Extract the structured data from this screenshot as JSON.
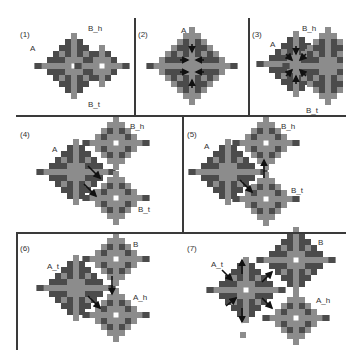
{
  "colors": {
    "dark": "#4b4b4b",
    "light": "#8c8c8c",
    "hole": "#ffffff",
    "arrow": "#111111",
    "divider": "#3a3a3a"
  },
  "cell": 6,
  "dividers": [
    {
      "x": 16,
      "y": 115,
      "w": 330,
      "h": 1.5
    },
    {
      "x": 16,
      "y": 232,
      "w": 330,
      "h": 1.5
    },
    {
      "x": 134,
      "y": 18,
      "w": 1.5,
      "h": 97
    },
    {
      "x": 248,
      "y": 18,
      "w": 1.5,
      "h": 97
    },
    {
      "x": 182,
      "y": 115,
      "w": 1.5,
      "h": 117
    },
    {
      "x": 16,
      "y": 232,
      "w": 1.5,
      "h": 118
    }
  ],
  "panels": [
    {
      "id": "1",
      "label": "(1)",
      "label_pos": [
        20,
        30
      ],
      "diamonds": [
        {
          "cx": 74,
          "cy": 66,
          "r": 5,
          "hole": true
        },
        {
          "cx": 102,
          "cy": 66,
          "r": 3,
          "hole": true
        }
      ],
      "node_labels": [
        {
          "text": "A",
          "x": 30,
          "y": 44
        },
        {
          "text": "B_h",
          "x": 88,
          "y": 24
        },
        {
          "text": "B_t",
          "x": 88,
          "y": 100
        }
      ],
      "arrows": []
    },
    {
      "id": "2",
      "label": "(2)",
      "label_pos": [
        138,
        30
      ],
      "diamonds": [
        {
          "cx": 192,
          "cy": 66,
          "r": 6,
          "hole": false
        }
      ],
      "node_labels": [
        {
          "text": "A",
          "x": 181,
          "y": 26
        }
      ],
      "arrows": [
        {
          "x1": 192,
          "y1": 44,
          "x2": 192,
          "y2": 52
        },
        {
          "x1": 192,
          "y1": 88,
          "x2": 192,
          "y2": 80
        },
        {
          "x1": 180,
          "y1": 60,
          "x2": 188,
          "y2": 60
        },
        {
          "x1": 204,
          "y1": 60,
          "x2": 196,
          "y2": 60
        },
        {
          "x1": 180,
          "y1": 72,
          "x2": 188,
          "y2": 72
        },
        {
          "x1": 204,
          "y1": 72,
          "x2": 196,
          "y2": 72
        }
      ]
    },
    {
      "id": "3",
      "label": "(3)",
      "label_pos": [
        252,
        30
      ],
      "diamonds": [
        {
          "cx": 296,
          "cy": 64,
          "r": 5,
          "hole": false
        },
        {
          "cx": 328,
          "cy": 66,
          "r": 6,
          "hole": false,
          "clip": [
            248,
            344
          ]
        }
      ],
      "node_labels": [
        {
          "text": "A",
          "x": 270,
          "y": 40
        },
        {
          "text": "B_h",
          "x": 302,
          "y": 24
        },
        {
          "text": "B_t",
          "x": 306,
          "y": 106
        }
      ],
      "arrows": [
        {
          "x1": 286,
          "y1": 54,
          "x2": 292,
          "y2": 60
        },
        {
          "x1": 306,
          "y1": 54,
          "x2": 300,
          "y2": 60
        },
        {
          "x1": 286,
          "y1": 76,
          "x2": 292,
          "y2": 70
        },
        {
          "x1": 306,
          "y1": 76,
          "x2": 300,
          "y2": 70
        },
        {
          "x1": 296,
          "y1": 46,
          "x2": 296,
          "y2": 54
        },
        {
          "x1": 296,
          "y1": 84,
          "x2": 296,
          "y2": 76
        }
      ]
    },
    {
      "id": "4",
      "label": "(4)",
      "label_pos": [
        20,
        130
      ],
      "diamonds": [
        {
          "cx": 76,
          "cy": 172,
          "r": 5,
          "hole": false
        },
        {
          "cx": 116,
          "cy": 143,
          "r": 4,
          "hole": true
        },
        {
          "cx": 116,
          "cy": 198,
          "r": 4,
          "hole": true
        }
      ],
      "node_labels": [
        {
          "text": "A",
          "x": 52,
          "y": 145
        },
        {
          "text": "B_h",
          "x": 130,
          "y": 122
        },
        {
          "text": "B_t",
          "x": 138,
          "y": 205
        }
      ],
      "arrows": [
        {
          "x1": 88,
          "y1": 166,
          "x2": 100,
          "y2": 178
        },
        {
          "x1": 84,
          "y1": 184,
          "x2": 96,
          "y2": 196
        }
      ]
    },
    {
      "id": "5",
      "label": "(5)",
      "label_pos": [
        187,
        130
      ],
      "diamonds": [
        {
          "cx": 228,
          "cy": 172,
          "r": 5,
          "hole": false
        },
        {
          "cx": 266,
          "cy": 143,
          "r": 4,
          "hole": true
        },
        {
          "cx": 266,
          "cy": 199,
          "r": 4,
          "hole": true
        }
      ],
      "node_labels": [
        {
          "text": "A",
          "x": 204,
          "y": 142
        },
        {
          "text": "B_h",
          "x": 281,
          "y": 122
        },
        {
          "text": "B_t",
          "x": 291,
          "y": 186
        }
      ],
      "arrows": [
        {
          "x1": 240,
          "y1": 180,
          "x2": 252,
          "y2": 192
        },
        {
          "x1": 264,
          "y1": 178,
          "x2": 264,
          "y2": 160
        }
      ]
    },
    {
      "id": "6",
      "label": "(6)",
      "label_pos": [
        20,
        244
      ],
      "diamonds": [
        {
          "cx": 76,
          "cy": 288,
          "r": 5,
          "hole": false
        },
        {
          "cx": 116,
          "cy": 259,
          "r": 4,
          "hole": true
        },
        {
          "cx": 116,
          "cy": 315,
          "r": 4,
          "hole": true
        }
      ],
      "node_labels": [
        {
          "text": "A_t",
          "x": 47,
          "y": 262
        },
        {
          "text": "B",
          "x": 133,
          "y": 240
        },
        {
          "text": "A_h",
          "x": 133,
          "y": 293
        }
      ],
      "arrows": [
        {
          "x1": 88,
          "y1": 296,
          "x2": 100,
          "y2": 308
        },
        {
          "x1": 112,
          "y1": 276,
          "x2": 112,
          "y2": 294
        }
      ]
    },
    {
      "id": "7",
      "label": "(7)",
      "label_pos": [
        187,
        244
      ],
      "diamonds": [
        {
          "cx": 246,
          "cy": 290,
          "r": 5,
          "hole": true
        },
        {
          "cx": 296,
          "cy": 260,
          "r": 5,
          "hole": true
        },
        {
          "cx": 296,
          "cy": 318,
          "r": 4,
          "hole": true
        }
      ],
      "node_labels": [
        {
          "text": "A_t",
          "x": 211,
          "y": 260
        },
        {
          "text": "B",
          "x": 318,
          "y": 238
        },
        {
          "text": "A_h",
          "x": 316,
          "y": 296
        }
      ],
      "arrows": [
        {
          "x1": 222,
          "y1": 270,
          "x2": 232,
          "y2": 280
        },
        {
          "x1": 226,
          "y1": 306,
          "x2": 236,
          "y2": 298
        },
        {
          "x1": 242,
          "y1": 274,
          "x2": 242,
          "y2": 260
        },
        {
          "x1": 242,
          "y1": 308,
          "x2": 242,
          "y2": 322
        },
        {
          "x1": 262,
          "y1": 282,
          "x2": 272,
          "y2": 272
        },
        {
          "x1": 262,
          "y1": 298,
          "x2": 272,
          "y2": 308
        }
      ],
      "extra_cells": [
        {
          "x": 240,
          "y": 332,
          "color": "light"
        }
      ]
    }
  ]
}
